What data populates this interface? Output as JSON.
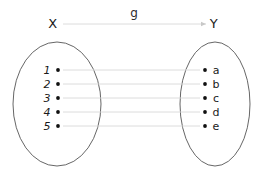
{
  "diagram": {
    "type": "function-mapping-diagram",
    "map_label": "g",
    "domain_set": {
      "name": "X",
      "label_x": 53,
      "label_y": 23,
      "ellipse": {
        "cx": 57,
        "cy": 104,
        "rx": 44,
        "ry": 62
      },
      "elements": [
        {
          "label": "1",
          "x": 58,
          "y": 70
        },
        {
          "label": "2",
          "x": 58,
          "y": 84
        },
        {
          "label": "3",
          "x": 58,
          "y": 98
        },
        {
          "label": "4",
          "x": 58,
          "y": 112
        },
        {
          "label": "5",
          "x": 58,
          "y": 126
        }
      ]
    },
    "codomain_set": {
      "name": "Y",
      "label_x": 214,
      "label_y": 23,
      "ellipse": {
        "cx": 215,
        "cy": 104,
        "rx": 35,
        "ry": 62
      },
      "elements": [
        {
          "label": "a",
          "x": 205,
          "y": 70
        },
        {
          "label": "b",
          "x": 205,
          "y": 84
        },
        {
          "label": "c",
          "x": 205,
          "y": 98
        },
        {
          "label": "d",
          "x": 205,
          "y": 112
        },
        {
          "label": "e",
          "x": 205,
          "y": 126
        }
      ]
    },
    "mappings": [
      {
        "from": "1",
        "to": "a",
        "y": 70
      },
      {
        "from": "2",
        "to": "b",
        "y": 84
      },
      {
        "from": "3",
        "to": "c",
        "y": 98
      },
      {
        "from": "4",
        "to": "d",
        "y": 112
      },
      {
        "from": "5",
        "to": "e",
        "y": 126
      }
    ],
    "top_arrow": {
      "x1": 63,
      "x2": 206,
      "y": 24,
      "label_x": 134,
      "label_y": 13
    },
    "colors": {
      "ellipse_stroke": "#555555",
      "connector_stroke": "#d8d8d8",
      "dot_fill": "#111111",
      "text": "#1a1a1a",
      "background": "#ffffff"
    }
  }
}
